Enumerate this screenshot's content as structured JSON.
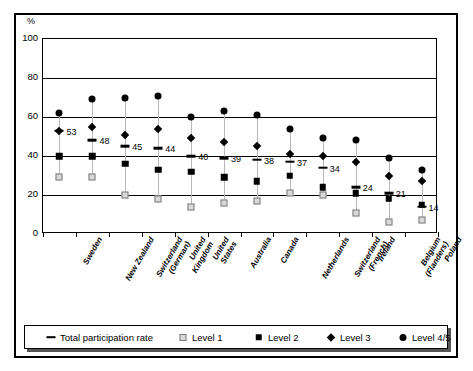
{
  "axis": {
    "unit_label": "%",
    "y_ticks": [
      0,
      20,
      40,
      60,
      80,
      100
    ],
    "x_labels": [
      "Sweden",
      "New Zealand",
      "Switzerland (German)",
      "United Kingdom",
      "United States",
      "Australia",
      "Canada",
      "Netherlands",
      "Switzerland (French)",
      "Ireland",
      "Belgium (Flanders)",
      "Poland"
    ]
  },
  "legend": {
    "items": [
      {
        "label": "Total participation rate",
        "marker": "dash-marker"
      },
      {
        "label": "Level 1",
        "marker": "open-square-marker"
      },
      {
        "label": "Level 2",
        "marker": "filled-square-marker"
      },
      {
        "label": "Level 3",
        "marker": "diamond-marker"
      },
      {
        "label": "Level 4/5",
        "marker": "circle-marker"
      }
    ]
  },
  "chart_data": {
    "type": "scatter",
    "title": "",
    "xlabel": "",
    "ylabel": "%",
    "ylim": [
      0,
      100
    ],
    "yticks": [
      0,
      20,
      40,
      60,
      80,
      100
    ],
    "grid": true,
    "legend_position": "bottom",
    "categories": [
      "Sweden",
      "New Zealand",
      "Switzerland (German)",
      "United Kingdom",
      "United States",
      "Australia",
      "Canada",
      "Netherlands",
      "Switzerland (French)",
      "Ireland",
      "Belgium (Flanders)",
      "Poland"
    ],
    "series": [
      {
        "name": "Total participation rate",
        "marker": "dash-marker",
        "values": [
          53,
          48,
          45,
          44,
          40,
          39,
          38,
          37,
          34,
          24,
          21,
          14
        ],
        "data_labels": [
          "53",
          "48",
          "45",
          "44",
          "40",
          "39",
          "38",
          "37",
          "34",
          "24",
          "21",
          "14"
        ]
      },
      {
        "name": "Level 1",
        "marker": "open-square-marker",
        "values": [
          29,
          29,
          20,
          18,
          14,
          16,
          17,
          21,
          20,
          11,
          6,
          7
        ]
      },
      {
        "name": "Level 2",
        "marker": "filled-square-marker",
        "values": [
          40,
          40,
          36,
          33,
          32,
          29,
          27,
          30,
          24,
          21,
          18,
          15
        ]
      },
      {
        "name": "Level 3",
        "marker": "diamond-marker",
        "values": [
          53,
          55,
          51,
          54,
          49,
          47,
          45,
          41,
          40,
          37,
          30,
          27
        ]
      },
      {
        "name": "Level 4/5",
        "marker": "circle-marker",
        "values": [
          62,
          69,
          70,
          71,
          60,
          63,
          61,
          54,
          49,
          48,
          39,
          33
        ]
      }
    ]
  }
}
